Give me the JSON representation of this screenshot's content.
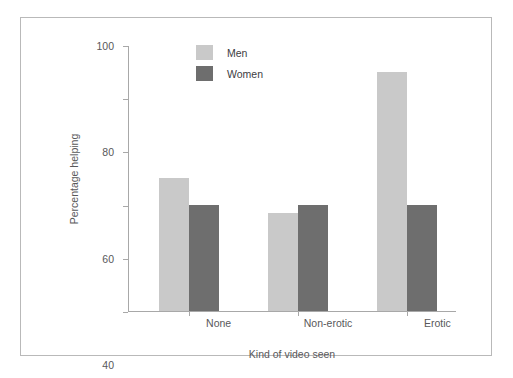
{
  "chart_data": {
    "type": "bar",
    "title": "",
    "subtitle": "",
    "xlabel": "Kind of video seen",
    "ylabel": "Percentage helping",
    "categories": [
      "None",
      "Non-erotic",
      "Erotic"
    ],
    "series": [
      {
        "name": "Men",
        "values": [
          50,
          37,
          90
        ],
        "color": "#c9c9c9"
      },
      {
        "name": "Women",
        "values": [
          40,
          40,
          40
        ],
        "color": "#6e6e6e"
      }
    ],
    "ylim": [
      0,
      100
    ],
    "yticks": [
      0,
      20,
      40,
      60,
      80,
      100
    ],
    "ytick_labels": [
      "0",
      "20",
      "40",
      "60",
      "80",
      "100"
    ],
    "grid": false,
    "legend_position": "top-center",
    "legend_entries": [
      "Men",
      "Women"
    ]
  },
  "figure": {
    "border_color": "#b9b9b9",
    "background": "#ffffff",
    "axis_color": "#a8a8a8",
    "text_color": "#58585a"
  }
}
